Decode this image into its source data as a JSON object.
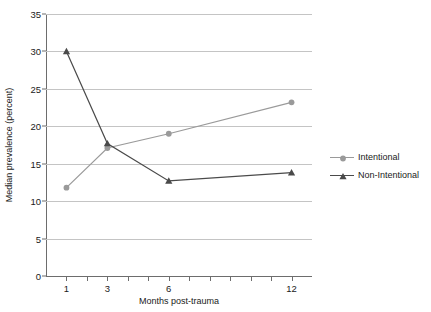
{
  "chart_data": {
    "type": "line",
    "title": "",
    "xlabel": "Months post-trauma",
    "ylabel": "Median prevalence (percent)",
    "x": [
      1,
      3,
      6,
      12
    ],
    "xlim": [
      0,
      13
    ],
    "ylim": [
      0,
      35
    ],
    "xtick_labels": [
      "1",
      "3",
      "6",
      "12"
    ],
    "ytick_labels": [
      "0",
      "5",
      "10",
      "15",
      "20",
      "25",
      "30",
      "35"
    ],
    "ytick_values": [
      0,
      5,
      10,
      15,
      20,
      25,
      30,
      35
    ],
    "grid": "horizontal",
    "legend_position": "right",
    "series": [
      {
        "name": "Intentional",
        "marker": "circle",
        "color": "#9a9a9a",
        "values": [
          11.8,
          17.1,
          19.0,
          23.2
        ]
      },
      {
        "name": "Non-Intentional",
        "marker": "triangle",
        "color": "#4a4a4a",
        "values": [
          30.0,
          17.7,
          12.7,
          13.8
        ]
      }
    ]
  },
  "colors": {
    "background": "#ffffff",
    "text": "#1a1a1a",
    "axis": "#6d6d6d",
    "gridline": "#c4c4c4",
    "intentional": "#9a9a9a",
    "non_intentional": "#4a4a4a"
  }
}
